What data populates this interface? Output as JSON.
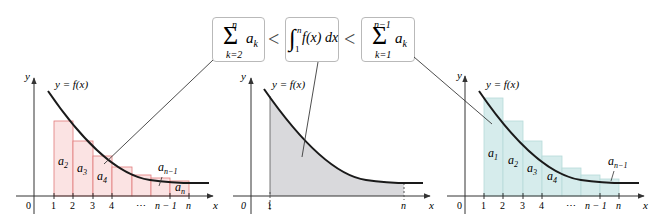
{
  "colors": {
    "curve": "#1a1a1a",
    "axis": "#333333",
    "left_fill": "#fbe3e3",
    "left_stroke": "#e07a7a",
    "middle_fill": "#d9d9dc",
    "right_fill": "#d6ecec",
    "right_stroke": "#b7dbd9",
    "leader": "#3a3a3a",
    "box_border": "#b9b9b9"
  },
  "formulas": {
    "box1": {
      "sigma": "Σ",
      "upper": "n",
      "lower": "k=2",
      "term": "a",
      "sub": "k"
    },
    "lt1": "<",
    "box2": {
      "integral": "∫",
      "upper": "n",
      "lower": "1",
      "integrand": "f(x) dx"
    },
    "lt2": "<",
    "box3": {
      "sigma": "Σ",
      "upper": "n−1",
      "lower": "k=1",
      "term": "a",
      "sub": "k"
    }
  },
  "graphs": {
    "left": {
      "y_label": "y",
      "x_label": "x",
      "origin_label": "0",
      "curve_label": "y = f(x)",
      "tick_labels": [
        "1",
        "2",
        "3",
        "4",
        "⋯",
        "n − 1",
        "n"
      ],
      "bar_labels": [
        {
          "base": "a",
          "sub": "2"
        },
        {
          "base": "a",
          "sub": "3"
        },
        {
          "base": "a",
          "sub": "4"
        },
        {
          "base": "a",
          "sub": "n−1"
        },
        {
          "base": "a",
          "sub": "n"
        }
      ]
    },
    "middle": {
      "y_label": "y",
      "x_label": "x",
      "origin_label": "0",
      "curve_label": "y = f(x)",
      "tick_labels": [
        "1",
        "n"
      ]
    },
    "right": {
      "y_label": "y",
      "x_label": "x",
      "origin_label": "0",
      "curve_label": "y = f(x)",
      "tick_labels": [
        "1",
        "2",
        "3",
        "4",
        "⋯",
        "n − 1",
        "n"
      ],
      "bar_labels": [
        {
          "base": "a",
          "sub": "1"
        },
        {
          "base": "a",
          "sub": "2"
        },
        {
          "base": "a",
          "sub": "3"
        },
        {
          "base": "a",
          "sub": "4"
        },
        {
          "base": "a",
          "sub": "n−1"
        }
      ]
    }
  }
}
